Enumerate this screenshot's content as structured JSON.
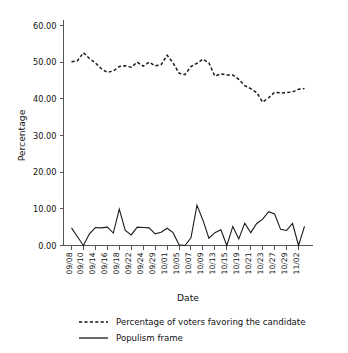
{
  "chart_data": {
    "type": "line",
    "title": "",
    "xlabel": "Date",
    "ylabel": "Percentage",
    "ylim": [
      0,
      60
    ],
    "yticks": [
      0,
      10,
      20,
      30,
      40,
      50,
      60
    ],
    "ytick_labels": [
      "0.00",
      "10.00",
      "20.00",
      "30.00",
      "40.00",
      "50.00",
      "60.00"
    ],
    "grid": false,
    "legend_position": "below",
    "x": [
      "09/08",
      "09/09",
      "09/10",
      "09/11",
      "09/14",
      "09/15",
      "09/16",
      "09/17",
      "09/18",
      "09/21",
      "09/22",
      "09/23",
      "09/24",
      "09/28",
      "09/29",
      "09/30",
      "10/01",
      "10/02",
      "10/05",
      "10/06",
      "10/07",
      "10/08",
      "10/09",
      "10/12",
      "10/13",
      "10/14",
      "10/15",
      "10/16",
      "10/19",
      "10/20",
      "10/21",
      "10/22",
      "10/23",
      "10/26",
      "10/27",
      "10/28",
      "10/29",
      "10/30",
      "11/02",
      "11/03"
    ],
    "xtick_labels": [
      "09/08",
      "09/10",
      "09/14",
      "09/16",
      "09/18",
      "09/22",
      "09/24",
      "09/29",
      "10/01",
      "10/05",
      "10/07",
      "10/09",
      "10/13",
      "10/15",
      "10/19",
      "10/21",
      "10/23",
      "10/27",
      "10/29",
      "11/02"
    ],
    "series": [
      {
        "name": "Percentage of voters favoring the candidate",
        "style": "dashed",
        "values": [
          50.1,
          50.4,
          52.6,
          51.0,
          49.8,
          48.2,
          47.2,
          47.6,
          48.8,
          49.0,
          48.6,
          50.0,
          48.9,
          50.0,
          49.0,
          49.3,
          51.9,
          49.8,
          47.0,
          46.6,
          48.8,
          49.7,
          50.8,
          49.8,
          46.2,
          46.8,
          46.5,
          46.5,
          45.3,
          43.6,
          42.8,
          41.7,
          39.1,
          40.3,
          41.8,
          41.6,
          41.7,
          41.9,
          42.6,
          42.8
        ]
      },
      {
        "name": "Populism frame",
        "style": "solid",
        "values": [
          4.8,
          2.4,
          0.0,
          3.2,
          4.9,
          4.8,
          5.0,
          3.4,
          9.9,
          4.1,
          2.9,
          5.0,
          4.9,
          4.8,
          3.2,
          3.6,
          4.7,
          3.5,
          0.2,
          0.0,
          2.1,
          11.0,
          6.9,
          2.0,
          3.5,
          4.3,
          0.0,
          5.2,
          1.8,
          6.1,
          3.5,
          6.0,
          7.2,
          9.2,
          8.6,
          4.4,
          4.1,
          6.0,
          0.0,
          5.2
        ]
      }
    ]
  },
  "legend": {
    "items": [
      {
        "label": "Percentage of voters favoring the candidate",
        "style": "dashed"
      },
      {
        "label": "Populism frame",
        "style": "solid"
      }
    ]
  }
}
